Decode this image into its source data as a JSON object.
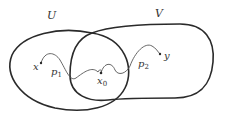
{
  "diagram": {
    "sets": [
      {
        "label": "U"
      },
      {
        "label": "V"
      }
    ],
    "points": {
      "start": {
        "label": "x"
      },
      "base": {
        "label": "x",
        "subscript": "0"
      },
      "end": {
        "label": "y"
      }
    },
    "paths": [
      {
        "label": "p",
        "subscript": "1"
      },
      {
        "label": "p",
        "subscript": "2"
      }
    ],
    "colors": {
      "stroke": "#2a2a2a",
      "path": "#555555",
      "text": "#333333"
    }
  }
}
